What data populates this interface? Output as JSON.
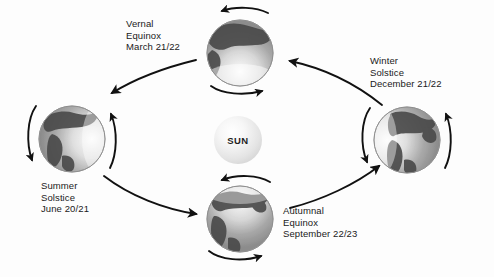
{
  "diagram": {
    "background_color": "#fdfdfd",
    "text_color": "#1a1a1a",
    "arrow_color": "#111111",
    "sun": {
      "label": "SUN",
      "center_x": 238,
      "center_y": 140,
      "radius": 24,
      "glow_color": "#f0f0f0"
    },
    "positions": [
      {
        "id": "vernal-equinox",
        "name": "Vernal Equinox",
        "season_line1": "Vernal",
        "season_line2": "Equinox",
        "date": "March 21/22",
        "orbit_slot": "top",
        "globe_cx": 240,
        "globe_cy": 53,
        "globe_r": 33,
        "terminator": "north-lit-upper",
        "light_from": "below"
      },
      {
        "id": "winter-solstice",
        "name": "Winter Solstice",
        "season_line1": "Winter",
        "season_line2": "Solstice",
        "date": "December 21/22",
        "orbit_slot": "right",
        "globe_cx": 407,
        "globe_cy": 140,
        "globe_r": 33,
        "terminator": "left-lit",
        "light_from": "left"
      },
      {
        "id": "summer-solstice",
        "name": "Summer Solstice",
        "season_line1": "Summer",
        "season_line2": "Solstice",
        "date": "June 20/21",
        "orbit_slot": "left",
        "globe_cx": 72,
        "globe_cy": 139,
        "globe_r": 33,
        "terminator": "right-lit",
        "light_from": "right"
      },
      {
        "id": "autumnal-equinox",
        "name": "Autumnal Equinox",
        "season_line1": "Autumnal",
        "season_line2": "Equinox",
        "date": "September 22/23",
        "orbit_slot": "bottom",
        "globe_cx": 240,
        "globe_cy": 219,
        "globe_r": 33,
        "terminator": "south-lit-upper",
        "light_from": "above"
      }
    ],
    "orbit_arrows": [
      {
        "id": "arrow-vernal-to-summer",
        "from": "vernal-equinox",
        "to": "summer-solstice",
        "direction": "down-left"
      },
      {
        "id": "arrow-summer-to-autumnal",
        "from": "summer-solstice",
        "to": "autumnal-equinox",
        "direction": "down-right"
      },
      {
        "id": "arrow-autumnal-to-winter",
        "from": "autumnal-equinox",
        "to": "winter-solstice",
        "direction": "up-right"
      },
      {
        "id": "arrow-winter-to-vernal",
        "from": "winter-solstice",
        "to": "vernal-equinox",
        "direction": "up-left"
      }
    ],
    "rotation_arrows": {
      "description": "Curved spin arrows drawn around each globe",
      "count_per_globe": 2
    }
  }
}
